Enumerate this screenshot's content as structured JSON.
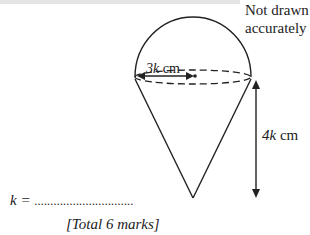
{
  "figure": {
    "note_line1": "Not drawn",
    "note_line2": "accurately",
    "radius_label_var": "3k",
    "radius_label_unit": " cm",
    "height_label_var": "4k",
    "height_label_unit": " cm"
  },
  "answer": {
    "prefix": "k = ",
    "dots": "...............................",
    "total": "[Total 6 marks]"
  }
}
